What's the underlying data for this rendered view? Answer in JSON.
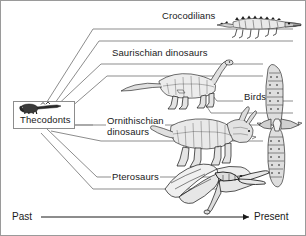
{
  "diagram": {
    "type": "cladogram",
    "root": {
      "label": "Thecodonts",
      "organism": "thecodont-reptile"
    },
    "branches": [
      {
        "label": "Crocodilians",
        "organism": "crocodile-illustration"
      },
      {
        "label": "Saurischian dinosaurs",
        "organism": "sauropod-illustration"
      },
      {
        "label": "Birds",
        "organism": "bird-illustration"
      },
      {
        "label": "Ornithischian\ndinosaurs",
        "organism": "ceratopsian-illustration"
      },
      {
        "label": "Pterosaurs",
        "organism": "pterosaur-illustration"
      }
    ],
    "axis": {
      "left_label": "Past",
      "right_label": "Present"
    },
    "colors": {
      "line": "#8d8d8d",
      "ink": "#1a1a1a",
      "background": "#ffffff",
      "border": "#9a9a9a"
    }
  }
}
